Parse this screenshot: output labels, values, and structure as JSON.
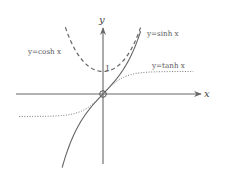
{
  "chart_data": {
    "type": "line",
    "title": "",
    "xlabel": "x",
    "ylabel": "y",
    "tick_labels": [
      {
        "axis": "y",
        "value": 1,
        "label": "1"
      }
    ],
    "grid": false,
    "legend_position": "inline labels near curves",
    "xlim": [
      -4.0,
      4.3
    ],
    "ylim": [
      -3.1,
      2.9
    ],
    "series": [
      {
        "name": "y=cosh x",
        "style": "dashed",
        "x": [
          -1.75,
          -1.5,
          -1.25,
          -1.0,
          -0.75,
          -0.5,
          -0.25,
          0,
          0.25,
          0.5,
          0.75,
          1.0,
          1.25,
          1.5,
          1.75
        ],
        "values": [
          2.964,
          2.352,
          1.888,
          1.543,
          1.295,
          1.128,
          1.031,
          1.0,
          1.031,
          1.128,
          1.295,
          1.543,
          1.888,
          2.352,
          2.964
        ]
      },
      {
        "name": "y=sinh x",
        "style": "solid",
        "x": [
          -1.9,
          -1.5,
          -1.0,
          -0.5,
          0,
          0.5,
          1.0,
          1.5,
          1.75
        ],
        "values": [
          -3.268,
          -2.129,
          -1.175,
          -0.521,
          0,
          0.521,
          1.175,
          2.129,
          2.79
        ]
      },
      {
        "name": "y=tanh x",
        "style": "dotted",
        "x": [
          -3.9,
          -3,
          -2,
          -1,
          -0.5,
          0,
          0.5,
          1,
          2,
          3,
          4.2
        ],
        "values": [
          -0.999,
          -0.995,
          -0.964,
          -0.762,
          -0.462,
          0,
          0.462,
          0.762,
          0.964,
          0.995,
          1.0
        ]
      }
    ],
    "annotations": [
      {
        "text": "y=cosh x",
        "position": "upper-left"
      },
      {
        "text": "y=sinh x",
        "position": "upper-right"
      },
      {
        "text": "y=tanh x",
        "position": "right"
      },
      {
        "text": "origin marker (circle)",
        "at": [
          0,
          0
        ]
      }
    ]
  },
  "labels": {
    "x_axis": "x",
    "y_axis": "y",
    "one": "1",
    "cosh": "y=cosh x",
    "sinh": "y=sinh x",
    "tanh": "y=tanh x"
  },
  "colors": {
    "axis": "#666666",
    "curve": "#666666",
    "text": "#555555",
    "background": "#ffffff"
  }
}
